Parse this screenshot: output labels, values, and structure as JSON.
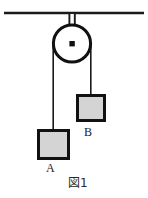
{
  "figure": {
    "caption": "図1",
    "colors": {
      "stroke": "#1a1a1a",
      "block_fill": "#d4d4d4",
      "block_border": "#111111",
      "background": "#ffffff"
    },
    "ceiling": {
      "label": "ceiling-support-line",
      "x1": 4,
      "x2": 144,
      "y": 13,
      "thickness": 2.6
    },
    "support_bar": {
      "label": "pulley-mount-bar",
      "x": 69.5,
      "y_top": 13,
      "y_bottom": 46,
      "width": 5.5
    },
    "pulley": {
      "label": "pulley-wheel",
      "cx": 72,
      "cy": 43.5,
      "r": 19,
      "rim_thickness": 3,
      "hub_size": 5
    },
    "rope_left": {
      "label": "rope-segment-left",
      "x": 53.2,
      "y_top": 43.5,
      "y_bottom": 129,
      "thickness": 1.5
    },
    "rope_right": {
      "label": "rope-segment-right",
      "x": 90.8,
      "y_top": 43.5,
      "y_bottom": 94,
      "thickness": 1.5
    },
    "blocks": [
      {
        "id": "block-a",
        "label": "A",
        "x": 37,
        "y": 129,
        "width": 33,
        "height": 31,
        "border": 3
      },
      {
        "id": "block-b",
        "label": "B",
        "x": 76,
        "y": 94,
        "width": 30,
        "height": 28,
        "border": 3
      }
    ]
  }
}
